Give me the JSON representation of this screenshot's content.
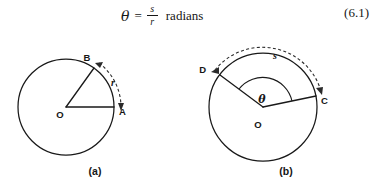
{
  "equation": {
    "theta": "θ",
    "equals": "=",
    "numerator": "s",
    "denominator": "r",
    "unit": "radians",
    "number": "(6.1)"
  },
  "figures": [
    {
      "caption": "(a)",
      "center_label": "O",
      "points": [
        "A",
        "B"
      ],
      "arc_label": "r",
      "arc_style": "dashed-double-arrow"
    },
    {
      "caption": "(b)",
      "center_label": "O",
      "points": [
        "C",
        "D"
      ],
      "arc_label": "s",
      "angle_label": "θ",
      "arc_style": "dashed-double-arrow"
    }
  ],
  "colors": {
    "ink": "#161616",
    "stroke": "#191919",
    "dashed": "#2a2a2a",
    "background": "#ffffff"
  }
}
